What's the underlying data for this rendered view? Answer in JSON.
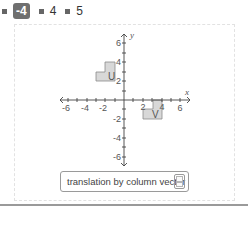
{
  "tabs": [
    {
      "label": "-4",
      "active": true
    },
    {
      "label": "4",
      "active": false
    },
    {
      "label": "5",
      "active": false
    }
  ],
  "graph": {
    "x_axis_label": "x",
    "y_axis_label": "y",
    "x_ticks": [
      "-6",
      "-4",
      "-2",
      "2",
      "4",
      "6"
    ],
    "y_ticks": [
      "6",
      "4",
      "2",
      "-2",
      "-4",
      "-6"
    ],
    "shape_u": {
      "label": "U",
      "cells": [
        [
          -3,
          2
        ],
        [
          -2,
          2
        ],
        [
          -2,
          3
        ]
      ]
    },
    "shape_v": {
      "label": "V",
      "cells": [
        [
          2,
          -2
        ],
        [
          3,
          -2
        ],
        [
          3,
          -1
        ]
      ]
    },
    "shape_fill": "#d8d8d8",
    "shape_stroke": "#8a8a8a"
  },
  "translation": {
    "label": "translation by column vector",
    "vector_top": "",
    "vector_bottom": ""
  }
}
